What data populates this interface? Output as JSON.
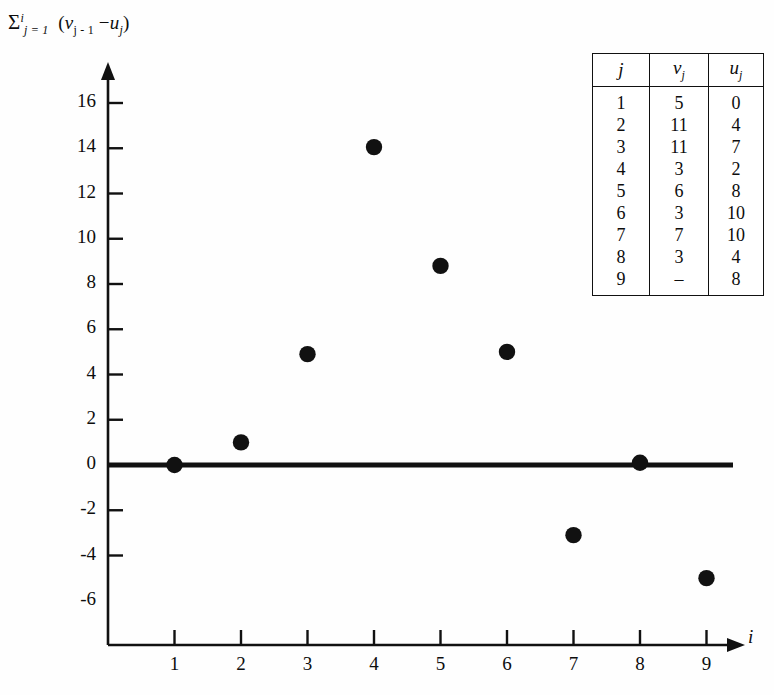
{
  "chart_data": {
    "type": "scatter",
    "title": "",
    "ylabel_parts": {
      "sigma": "Σ",
      "upper": "i",
      "lower": "j = 1",
      "expr_open": "(",
      "v": "v",
      "v_sub": "j - 1",
      "minus": "−",
      "u": "u",
      "u_sub": "j",
      "expr_close": ")"
    },
    "xlabel": "i",
    "x": [
      1,
      2,
      3,
      4,
      5,
      6,
      7,
      8,
      9
    ],
    "values": [
      0,
      1,
      4.9,
      14.05,
      8.8,
      5.0,
      -3.1,
      0.1,
      -5.0
    ],
    "xticks": [
      "1",
      "2",
      "3",
      "4",
      "5",
      "6",
      "7",
      "8",
      "9"
    ],
    "yticks": [
      "-6",
      "-4",
      "-2",
      "0",
      "2",
      "4",
      "6",
      "8",
      "10",
      "12",
      "14",
      "16"
    ],
    "ylim": [
      -6,
      17.5
    ],
    "xlim": [
      0,
      9.8
    ],
    "grid": false,
    "legend": "none",
    "marker_color": "#111111",
    "axis_color": "#111111",
    "zero_line": true
  },
  "table": {
    "headers": [
      {
        "base": "j",
        "sub": ""
      },
      {
        "base": "v",
        "sub": "j"
      },
      {
        "base": "u",
        "sub": "j"
      }
    ],
    "rows": [
      {
        "j": "1",
        "v": "5",
        "u": "0"
      },
      {
        "j": "2",
        "v": "11",
        "u": "4"
      },
      {
        "j": "3",
        "v": "11",
        "u": "7"
      },
      {
        "j": "4",
        "v": "3",
        "u": "2"
      },
      {
        "j": "5",
        "v": "6",
        "u": "8"
      },
      {
        "j": "6",
        "v": "3",
        "u": "10"
      },
      {
        "j": "7",
        "v": "7",
        "u": "10"
      },
      {
        "j": "8",
        "v": "3",
        "u": "4"
      },
      {
        "j": "9",
        "v": "–",
        "u": "8"
      }
    ]
  }
}
